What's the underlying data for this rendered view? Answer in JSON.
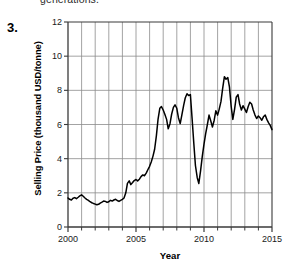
{
  "page": {
    "cutoff_text": "generations.",
    "item_number": "3."
  },
  "colors": {
    "line": "#000000",
    "grid": "#8c8c8c",
    "axis": "#3a3a3a",
    "text": "#1a1a1a",
    "background": "#ffffff"
  },
  "chart_data": {
    "type": "line",
    "title": "",
    "xlabel": "Year",
    "ylabel": "Selling Price (thousand USD/tonne)",
    "xlim": [
      2000,
      2015
    ],
    "ylim": [
      0,
      12
    ],
    "xticks": [
      2000,
      2005,
      2010,
      2015
    ],
    "xtick_labels": [
      "2000",
      "2005",
      "2010",
      "2015"
    ],
    "xminor_ticks": [
      2001,
      2002,
      2003,
      2004,
      2006,
      2007,
      2008,
      2009,
      2011,
      2012,
      2013,
      2014
    ],
    "yticks": [
      0,
      2,
      4,
      6,
      8,
      10,
      12
    ],
    "ytick_labels": [
      "0",
      "2",
      "4",
      "6",
      "8",
      "10",
      "12"
    ],
    "grid": {
      "vertical": true,
      "horizontal": true
    },
    "legend": null,
    "series": [
      {
        "name": "Selling Price",
        "x": [
          2000.0,
          2000.12,
          2000.25,
          2000.37,
          2000.5,
          2000.62,
          2000.75,
          2000.87,
          2001.0,
          2001.12,
          2001.25,
          2001.37,
          2001.5,
          2001.62,
          2001.75,
          2001.87,
          2002.0,
          2002.12,
          2002.25,
          2002.37,
          2002.5,
          2002.62,
          2002.75,
          2002.87,
          2003.0,
          2003.12,
          2003.25,
          2003.37,
          2003.5,
          2003.62,
          2003.75,
          2003.87,
          2004.0,
          2004.12,
          2004.25,
          2004.37,
          2004.5,
          2004.62,
          2004.75,
          2004.87,
          2005.0,
          2005.12,
          2005.25,
          2005.37,
          2005.5,
          2005.62,
          2005.75,
          2005.87,
          2006.0,
          2006.12,
          2006.25,
          2006.37,
          2006.5,
          2006.62,
          2006.75,
          2006.87,
          2007.0,
          2007.12,
          2007.25,
          2007.37,
          2007.5,
          2007.62,
          2007.75,
          2007.87,
          2008.0,
          2008.12,
          2008.25,
          2008.37,
          2008.5,
          2008.62,
          2008.75,
          2008.87,
          2009.0,
          2009.12,
          2009.25,
          2009.37,
          2009.5,
          2009.62,
          2009.75,
          2009.87,
          2010.0,
          2010.12,
          2010.25,
          2010.37,
          2010.5,
          2010.62,
          2010.75,
          2010.87,
          2011.0,
          2011.12,
          2011.25,
          2011.37,
          2011.5,
          2011.62,
          2011.75,
          2011.87,
          2012.0,
          2012.12,
          2012.25,
          2012.37,
          2012.5,
          2012.62,
          2012.75,
          2012.87,
          2013.0,
          2013.12,
          2013.25,
          2013.37,
          2013.5,
          2013.62,
          2013.75,
          2013.87,
          2014.0,
          2014.12,
          2014.25,
          2014.37,
          2014.5,
          2014.62,
          2014.75,
          2014.87,
          2015.0
        ],
        "y": [
          1.7,
          1.62,
          1.58,
          1.68,
          1.72,
          1.66,
          1.74,
          1.82,
          1.88,
          1.8,
          1.7,
          1.62,
          1.56,
          1.48,
          1.42,
          1.38,
          1.34,
          1.3,
          1.33,
          1.4,
          1.46,
          1.52,
          1.5,
          1.44,
          1.48,
          1.56,
          1.52,
          1.58,
          1.62,
          1.55,
          1.5,
          1.56,
          1.62,
          1.7,
          2.0,
          2.55,
          2.7,
          2.48,
          2.6,
          2.72,
          2.78,
          2.7,
          2.8,
          2.95,
          3.05,
          3.0,
          3.15,
          3.35,
          3.55,
          3.8,
          4.15,
          4.55,
          5.35,
          6.3,
          6.95,
          7.05,
          6.85,
          6.6,
          6.3,
          5.75,
          6.05,
          6.6,
          7.0,
          7.15,
          6.95,
          6.4,
          6.05,
          6.55,
          7.1,
          7.55,
          7.8,
          7.7,
          7.75,
          6.4,
          4.9,
          3.6,
          2.9,
          2.55,
          3.3,
          4.1,
          4.85,
          5.45,
          6.0,
          6.55,
          6.2,
          5.85,
          6.25,
          6.8,
          6.55,
          6.9,
          7.35,
          8.1,
          8.8,
          8.65,
          8.75,
          8.2,
          7.05,
          6.3,
          6.9,
          7.6,
          7.75,
          7.2,
          6.85,
          7.1,
          6.9,
          6.7,
          7.05,
          7.3,
          7.2,
          6.85,
          6.55,
          6.35,
          6.5,
          6.4,
          6.25,
          6.45,
          6.55,
          6.3,
          6.1,
          5.95,
          5.7
        ]
      }
    ],
    "annotations": [
      {
        "label": "early-plateau",
        "value": "~1.3-1.9 (2000-2004)"
      },
      {
        "label": "first-peak",
        "value": "~7.8 (2008)"
      },
      {
        "label": "crash-trough",
        "value": "~2.5 (2009)"
      },
      {
        "label": "maximum",
        "value": "~8.8 (2011)"
      },
      {
        "label": "final-value",
        "value": "~5.7 (2015)"
      }
    ]
  }
}
